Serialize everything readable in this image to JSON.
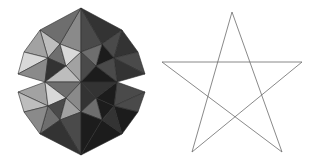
{
  "canvas": {
    "width": 320,
    "height": 167,
    "background": "#ffffff"
  },
  "figures": [
    {
      "name": "stellated-polyhedron",
      "label": "Small stellated dodecahedron",
      "type": "shaded-3d-solid",
      "panel": {
        "x": 0,
        "y": 0,
        "width": 160,
        "height": 167
      },
      "bounds": {
        "x": 18,
        "y": 8,
        "width": 127,
        "height": 147
      },
      "center": {
        "x": 81,
        "y": 82
      },
      "spike_count": 12,
      "edge_color": "#2b2b2b",
      "edge_width": 0.6,
      "shades": {
        "lightest": "#d8d8d8",
        "light": "#bdbdbd",
        "mid_light": "#a2a2a2",
        "mid": "#8a8a8a",
        "mid_dark": "#6e6e6e",
        "dark": "#4a4a4a",
        "darker": "#333333",
        "darkest": "#1c1c1c"
      },
      "faces": [
        {
          "points": "81,8 60,44 81,52",
          "fill": "#8a8a8a"
        },
        {
          "points": "81,8 102,44 81,52",
          "fill": "#4a4a4a"
        },
        {
          "points": "81,8 60,44 40,30",
          "fill": "#6e6e6e"
        },
        {
          "points": "81,8 102,44 122,30",
          "fill": "#333333"
        },
        {
          "points": "40,30 60,44 48,58",
          "fill": "#bdbdbd"
        },
        {
          "points": "122,30 102,44 114,58",
          "fill": "#4a4a4a"
        },
        {
          "points": "40,30 48,58 24,52",
          "fill": "#a2a2a2"
        },
        {
          "points": "122,30 114,58 138,52",
          "fill": "#333333"
        },
        {
          "points": "18,74 24,52 48,58",
          "fill": "#d8d8d8"
        },
        {
          "points": "145,74 138,52 114,58",
          "fill": "#4a4a4a"
        },
        {
          "points": "18,74 48,58 45,82",
          "fill": "#8a8a8a"
        },
        {
          "points": "145,74 114,58 117,82",
          "fill": "#333333"
        },
        {
          "points": "48,58 60,44 66,66",
          "fill": "#6e6e6e"
        },
        {
          "points": "114,58 102,44 96,66",
          "fill": "#1c1c1c"
        },
        {
          "points": "60,44 81,52 66,66",
          "fill": "#d8d8d8"
        },
        {
          "points": "102,44 81,52 96,66",
          "fill": "#6e6e6e"
        },
        {
          "points": "48,58 66,66 45,82",
          "fill": "#333333"
        },
        {
          "points": "114,58 96,66 117,82",
          "fill": "#4a4a4a"
        },
        {
          "points": "66,66 81,52 81,82",
          "fill": "#a2a2a2"
        },
        {
          "points": "96,66 81,52 81,82",
          "fill": "#4a4a4a"
        },
        {
          "points": "66,66 81,82 45,82",
          "fill": "#bdbdbd"
        },
        {
          "points": "96,66 81,82 117,82",
          "fill": "#1c1c1c"
        },
        {
          "points": "45,82 81,82 66,98",
          "fill": "#6e6e6e"
        },
        {
          "points": "117,82 81,82 96,98",
          "fill": "#333333"
        },
        {
          "points": "18,92 45,82 48,106",
          "fill": "#a2a2a2"
        },
        {
          "points": "145,92 117,82 114,106",
          "fill": "#4a4a4a"
        },
        {
          "points": "45,82 48,106 66,98",
          "fill": "#d8d8d8"
        },
        {
          "points": "117,82 114,106 96,98",
          "fill": "#1c1c1c"
        },
        {
          "points": "66,98 81,82 81,112",
          "fill": "#8a8a8a"
        },
        {
          "points": "96,98 81,82 81,112",
          "fill": "#333333"
        },
        {
          "points": "48,106 66,98 60,120",
          "fill": "#4a4a4a"
        },
        {
          "points": "114,106 96,98 102,120",
          "fill": "#1c1c1c"
        },
        {
          "points": "66,98 81,112 60,120",
          "fill": "#a2a2a2"
        },
        {
          "points": "96,98 81,112 102,120",
          "fill": "#6e6e6e"
        },
        {
          "points": "40,134 48,106 60,120",
          "fill": "#6e6e6e"
        },
        {
          "points": "122,134 114,106 102,120",
          "fill": "#333333"
        },
        {
          "points": "24,112 18,92 48,106",
          "fill": "#bdbdbd"
        },
        {
          "points": "138,112 145,92 114,106",
          "fill": "#4a4a4a"
        },
        {
          "points": "24,112 48,106 40,134",
          "fill": "#8a8a8a"
        },
        {
          "points": "138,112 114,106 122,134",
          "fill": "#1c1c1c"
        },
        {
          "points": "81,155 60,120 81,112",
          "fill": "#4a4a4a"
        },
        {
          "points": "81,155 102,120 81,112",
          "fill": "#1c1c1c"
        },
        {
          "points": "81,155 60,120 40,134",
          "fill": "#333333"
        },
        {
          "points": "81,155 102,120 122,134",
          "fill": "#1c1c1c"
        }
      ]
    },
    {
      "name": "pentagram",
      "label": "Pentagram",
      "type": "line-outline",
      "panel": {
        "x": 160,
        "y": 0,
        "width": 160,
        "height": 167
      },
      "stroke_color": "#6b6b6b",
      "stroke_width": 0.8,
      "fill": "none",
      "closed": true,
      "vertices": [
        {
          "name": "top",
          "x": 72,
          "y": 12
        },
        {
          "name": "bottom-right",
          "x": 122,
          "y": 152
        },
        {
          "name": "left",
          "x": 2,
          "y": 62
        },
        {
          "name": "right",
          "x": 142,
          "y": 62
        },
        {
          "name": "bottom-left",
          "x": 32,
          "y": 152
        }
      ],
      "path_order": "top -> bottom-right -> left -> right -> bottom-left -> top"
    }
  ]
}
